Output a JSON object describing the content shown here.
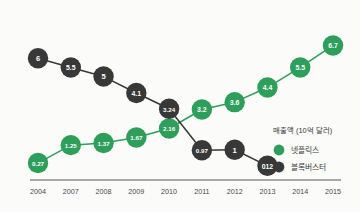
{
  "chart_data": {
    "type": "line",
    "title": "",
    "xlabel": "",
    "ylabel": "매출액 (10억 달러)",
    "categories": [
      "2004",
      "2007",
      "2008",
      "2009",
      "2010",
      "2011",
      "2012",
      "2013",
      "2014",
      "2015"
    ],
    "grid": false,
    "legend_position": "right",
    "ylim": [
      0,
      7
    ],
    "series": [
      {
        "name": "넷플릭스",
        "color": "#2e9e5b",
        "values": [
          0.27,
          1.25,
          1.37,
          1.67,
          2.16,
          3.2,
          3.6,
          4.4,
          5.5,
          6.7
        ],
        "labels": [
          "0.27",
          "1.25",
          "1.37",
          "1.67",
          "2.16",
          "3.2",
          "3.6",
          "4.4",
          "5.5",
          "6.7"
        ]
      },
      {
        "name": "블록버스터",
        "color": "#383838",
        "values": [
          6,
          5.5,
          5,
          4.1,
          3.24,
          0.97,
          1,
          0.12,
          null,
          null
        ],
        "labels": [
          "6",
          "5.5",
          "5",
          "4.1",
          "3.24",
          "0.97",
          "1",
          "012",
          "",
          ""
        ]
      }
    ]
  },
  "legend": {
    "title": "매출액 (10억 달러)",
    "items": [
      {
        "label": "넷플릭스",
        "color": "#2e9e5b"
      },
      {
        "label": "블록버스터",
        "color": "#383838"
      }
    ]
  },
  "axis": {
    "ticks": [
      "2004",
      "2007",
      "2008",
      "2009",
      "2010",
      "2011",
      "2012",
      "2013",
      "2014",
      "2015"
    ],
    "line_color": "#8d8d8d"
  },
  "colors": {
    "netflix_green": "#2e9e5b",
    "blockbuster_dark": "#383838",
    "background": "#fbfbf9",
    "axis": "#8d8d8d",
    "tick_text": "#4a4a4a"
  }
}
